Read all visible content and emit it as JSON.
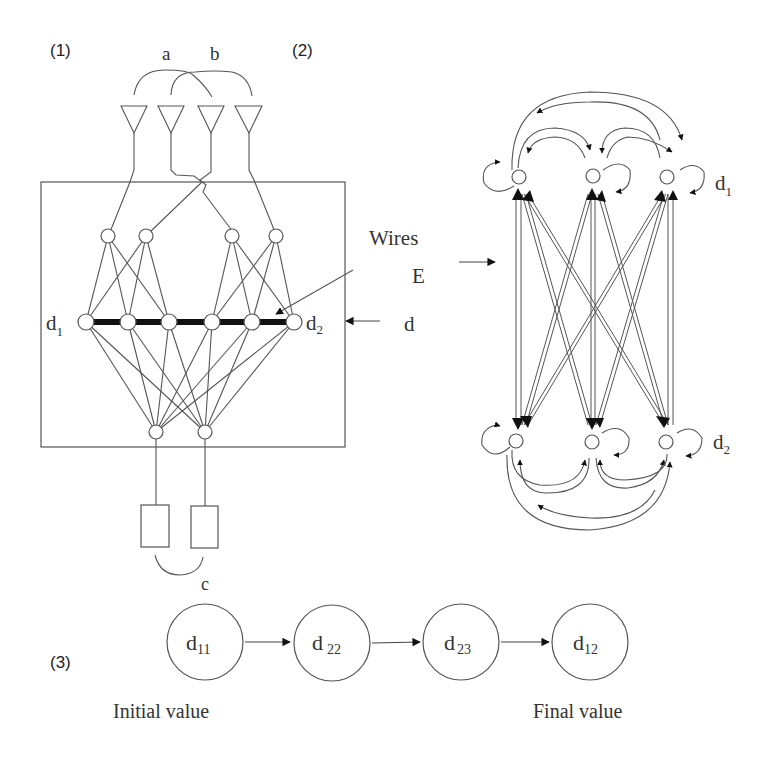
{
  "panels": {
    "p1": {
      "label": "(1)",
      "arc_labels": {
        "a": "a",
        "b": "b",
        "c": "c"
      },
      "node_labels": {
        "left": "d",
        "left_sub": "1",
        "right": "d",
        "right_sub": "2"
      },
      "input_arrow_label": "d",
      "wires_label": "Wires",
      "e_label": "E",
      "structure": {
        "antennas": 4,
        "upper_nodes": 4,
        "middle_nodes": 6,
        "lower_nodes": 2,
        "output_boxes": 2
      }
    },
    "p2": {
      "label": "(2)",
      "top_row_label": "d",
      "top_row_sub": "1",
      "bottom_row_label": "d",
      "bottom_row_sub": "2",
      "structure": {
        "top_nodes": 3,
        "bottom_nodes": 3,
        "self_loops": 6
      }
    },
    "p3": {
      "label": "(3)",
      "chain": [
        {
          "main": "d",
          "sub": "11"
        },
        {
          "main": "d",
          "sub": "22"
        },
        {
          "main": "d",
          "sub": "23"
        },
        {
          "main": "d",
          "sub": "12"
        }
      ],
      "initial_label": "Initial value",
      "final_label": "Final value"
    }
  },
  "colors": {
    "line": "#555555",
    "heavy": "#111111",
    "text": "#333333",
    "background": "#ffffff"
  }
}
